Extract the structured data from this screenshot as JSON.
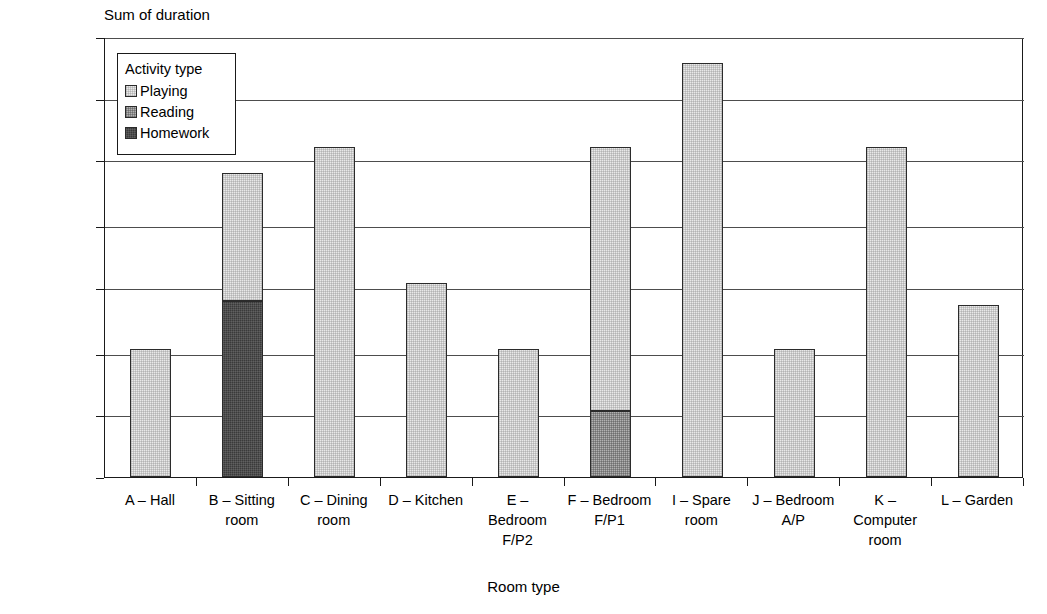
{
  "chart_data": {
    "type": "bar",
    "stacked": true,
    "title": "",
    "ylabel": "Sum of duration",
    "xlabel": "Room type",
    "grid": true,
    "legend_position": "inside-top-left",
    "legend_title": "Activity type",
    "categories": [
      "A – Hall",
      "B – Sitting room",
      "C – Dining room",
      "D – Kitchen",
      "E – Bedroom F/P2",
      "F – Bedroom F/P1",
      "I – Spare room",
      "J – Bedroom A/P",
      "K – Computer room",
      "L – Garden"
    ],
    "category_lines": [
      [
        "A – Hall"
      ],
      [
        "B – Sitting",
        "room"
      ],
      [
        "C – Dining",
        "room"
      ],
      [
        "D – Kitchen"
      ],
      [
        "E –",
        "Bedroom",
        "F/P2"
      ],
      [
        "F – Bedroom",
        "F/P1"
      ],
      [
        "I – Spare",
        "room"
      ],
      [
        "J – Bedroom",
        "A/P"
      ],
      [
        "K –",
        "Computer",
        "room"
      ],
      [
        "L – Garden"
      ]
    ],
    "ytick_labels": [
      "00:00:00",
      "00:00:14",
      "00:00:28",
      "00:00:43",
      "00:00:57",
      "00:01:12",
      "00:01:26",
      "00:01:40"
    ],
    "ytick_values": [
      0,
      14,
      28,
      43,
      57,
      72,
      86,
      100
    ],
    "ylim": [
      0,
      100
    ],
    "yunit": "seconds",
    "series": [
      {
        "name": "Playing",
        "color": "#e9e9e9",
        "values": [
          29,
          29,
          75,
          44,
          29,
          60,
          94,
          29,
          75,
          39
        ]
      },
      {
        "name": "Reading",
        "color": "#b2b2b2",
        "values": [
          0,
          0,
          0,
          0,
          0,
          15,
          0,
          0,
          0,
          0
        ]
      },
      {
        "name": "Homework",
        "color": "#3a3a3a",
        "values": [
          0,
          40,
          0,
          0,
          0,
          0,
          0,
          0,
          0,
          0
        ]
      }
    ],
    "totals": [
      29,
      69,
      75,
      44,
      29,
      75,
      94,
      29,
      75,
      39
    ]
  },
  "legend": {
    "title": "Activity type",
    "entries": [
      {
        "label": "Playing",
        "swatch": "playing-swatch"
      },
      {
        "label": "Reading",
        "swatch": "reading-swatch"
      },
      {
        "label": "Homework",
        "swatch": "homework-swatch"
      }
    ]
  }
}
